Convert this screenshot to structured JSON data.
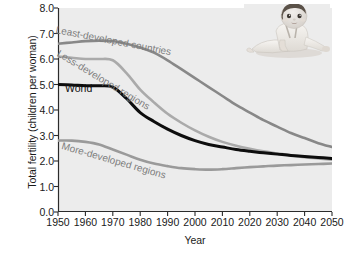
{
  "chart_data": {
    "type": "line",
    "title": "",
    "xlabel": "Year",
    "ylabel": "Total fertility (children per woman)",
    "xlim": [
      1950,
      2050
    ],
    "ylim": [
      0.0,
      8.0
    ],
    "xticks": [
      1950,
      1960,
      1970,
      1980,
      1990,
      2000,
      2010,
      2020,
      2030,
      2040,
      2050
    ],
    "xticklabels": [
      "1950",
      "1960",
      "1970",
      "1980",
      "1990",
      "2000",
      "2010",
      "2020",
      "2030",
      "2040",
      "2050"
    ],
    "yticks": [
      0.0,
      1.0,
      2.0,
      3.0,
      4.0,
      5.0,
      6.0,
      7.0,
      8.0
    ],
    "yticklabels": [
      "0.0",
      "1.0",
      "2.0",
      "3.0",
      "4.0",
      "5.0",
      "6.0",
      "7.0",
      "8.0"
    ],
    "grid": false,
    "legend_position": "inline-annotations",
    "plot_background": "#ececec",
    "x": [
      1950,
      1955,
      1960,
      1965,
      1970,
      1975,
      1980,
      1985,
      1990,
      1995,
      2000,
      2005,
      2010,
      2015,
      2020,
      2025,
      2030,
      2035,
      2040,
      2045,
      2050
    ],
    "series": [
      {
        "name": "Least-developed countries",
        "color": "#888888",
        "width": 2.6,
        "values": [
          6.6,
          6.65,
          6.7,
          6.72,
          6.7,
          6.6,
          6.45,
          6.25,
          5.95,
          5.6,
          5.25,
          4.9,
          4.55,
          4.2,
          3.9,
          3.6,
          3.35,
          3.1,
          2.9,
          2.7,
          2.55
        ]
      },
      {
        "name": "Less-developed regions",
        "color": "#aaaaaa",
        "width": 2.6,
        "values": [
          6.1,
          6.05,
          6.0,
          6.0,
          5.95,
          5.45,
          4.8,
          4.3,
          3.85,
          3.5,
          3.2,
          2.95,
          2.75,
          2.6,
          2.48,
          2.38,
          2.3,
          2.22,
          2.15,
          2.1,
          2.05
        ]
      },
      {
        "name": "World",
        "color": "#0d0d0d",
        "width": 3.0,
        "values": [
          5.0,
          4.98,
          4.95,
          4.95,
          4.9,
          4.45,
          3.9,
          3.55,
          3.25,
          3.0,
          2.8,
          2.65,
          2.55,
          2.45,
          2.38,
          2.32,
          2.27,
          2.22,
          2.18,
          2.14,
          2.1
        ]
      },
      {
        "name": "More-developed regions",
        "color": "#9a9a9a",
        "width": 2.6,
        "values": [
          2.8,
          2.8,
          2.75,
          2.65,
          2.45,
          2.25,
          2.05,
          1.9,
          1.8,
          1.72,
          1.68,
          1.66,
          1.68,
          1.72,
          1.76,
          1.79,
          1.82,
          1.84,
          1.86,
          1.88,
          1.9
        ]
      }
    ],
    "annotations": [
      {
        "name": "least-developed-countries",
        "text": "Least-developed countries",
        "x": 56,
        "y": 24,
        "rotate": 11,
        "style": "dark"
      },
      {
        "name": "less-developed-regions",
        "text": "Less-developed regions",
        "x": 58,
        "y": 47,
        "rotate": 31,
        "style": "dark"
      },
      {
        "name": "world",
        "text": "World",
        "x": 65,
        "y": 82,
        "rotate": 0,
        "style": "world"
      },
      {
        "name": "more-developed-regions",
        "text": "More-developed regions",
        "x": 62,
        "y": 140,
        "rotate": 16,
        "style": "dark"
      }
    ],
    "image": {
      "name": "baby-photo",
      "description": "Grayscale photograph of a baby crawling"
    }
  }
}
